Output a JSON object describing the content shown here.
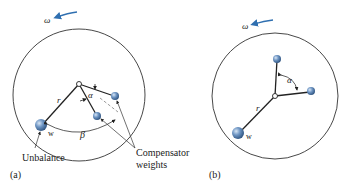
{
  "colors": {
    "rotation_arrow": "#2f6fb0",
    "weight_fill": "#5b86b8",
    "weight_highlight": "#cfe0f2",
    "line": "#2a2a2a"
  },
  "figure_a": {
    "panel_label": "(a)",
    "omega_label": "ω",
    "r_label": "r",
    "alpha_label": "α",
    "beta_label": "β",
    "w_label": "w",
    "unbalance_label": "Unbalance",
    "compensator_label_line1": "Compensator",
    "compensator_label_line2": "weights"
  },
  "figure_b": {
    "panel_label": "(b)",
    "omega_label": "ω",
    "r_label": "r",
    "alpha_label": "α",
    "w_label": "w"
  }
}
